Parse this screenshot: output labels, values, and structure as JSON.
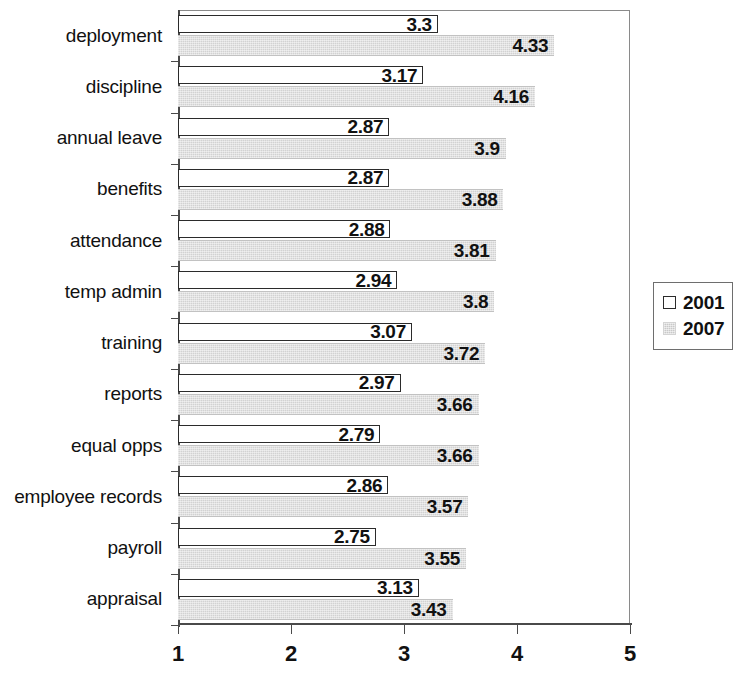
{
  "chart_data": {
    "type": "bar",
    "orientation": "horizontal",
    "title": "",
    "xlabel": "",
    "ylabel": "",
    "xlim": [
      1,
      5
    ],
    "xticks": [
      "1",
      "2",
      "3",
      "4",
      "5"
    ],
    "grid": false,
    "legend_position": "right",
    "categories": [
      "deployment",
      "discipline",
      "annual leave",
      "benefits",
      "attendance",
      "temp admin",
      "training",
      "reports",
      "equal opps",
      "employee records",
      "payroll",
      "appraisal"
    ],
    "series": [
      {
        "name": "2001",
        "color": "#ffffff",
        "values": [
          3.3,
          3.17,
          2.87,
          2.87,
          2.88,
          2.94,
          3.07,
          2.97,
          2.79,
          2.86,
          2.75,
          3.13
        ],
        "labels": [
          "3.3",
          "3.17",
          "2.87",
          "2.87",
          "2.88",
          "2.94",
          "3.07",
          "2.97",
          "2.79",
          "2.86",
          "2.75",
          "3.13"
        ]
      },
      {
        "name": "2007",
        "color": "#d2d2d2",
        "values": [
          4.33,
          4.16,
          3.9,
          3.88,
          3.81,
          3.8,
          3.72,
          3.66,
          3.66,
          3.57,
          3.55,
          3.43
        ],
        "labels": [
          "4.33",
          "4.16",
          "3.9",
          "3.88",
          "3.81",
          "3.8",
          "3.72",
          "3.66",
          "3.66",
          "3.57",
          "3.55",
          "3.43"
        ]
      }
    ]
  },
  "legend": {
    "items": [
      {
        "label": "2001",
        "swatch": "white-square-icon"
      },
      {
        "label": "2007",
        "swatch": "gray-square-icon"
      }
    ]
  }
}
